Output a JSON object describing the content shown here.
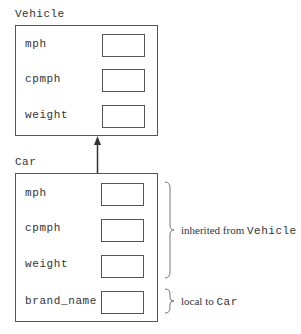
{
  "diagram": {
    "classes": [
      {
        "name": "Vehicle",
        "fields": [
          "mph",
          "cpmph",
          "weight"
        ]
      },
      {
        "name": "Car",
        "fields": [
          "mph",
          "cpmph",
          "weight",
          "brand_name"
        ]
      }
    ],
    "arrow": {
      "from": "Car",
      "to": "Vehicle",
      "type": "inheritance"
    },
    "annotations": [
      {
        "prefix": "inherited from ",
        "ref": "Vehicle",
        "covers": [
          "mph",
          "cpmph",
          "weight"
        ]
      },
      {
        "prefix": "local to ",
        "ref": "Car",
        "covers": [
          "brand_name"
        ]
      }
    ]
  }
}
